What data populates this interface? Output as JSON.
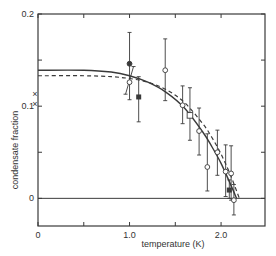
{
  "chart_data": {
    "type": "scatter",
    "title": "",
    "xlabel": "temperature (K)",
    "ylabel": "condensate fraction",
    "xlim": [
      0,
      2.48
    ],
    "ylim": [
      -0.03,
      0.2
    ],
    "grid": false,
    "legend": null,
    "x_ticks": [
      0,
      0.5,
      1.0,
      1.5,
      2.0
    ],
    "x_tick_labels": [
      "0",
      "",
      "1.0",
      "",
      "2.0"
    ],
    "y_ticks": [
      0,
      0.05,
      0.1,
      0.15,
      0.2
    ],
    "y_tick_labels": [
      "0",
      "",
      "0.1",
      "",
      "0.2"
    ],
    "zero_line": true,
    "axis_markers": [
      {
        "marker": "x",
        "x": 0,
        "y": 0.113
      },
      {
        "marker": "x",
        "x": 0,
        "y": 0.102
      }
    ],
    "series": [
      {
        "name": "filled circle",
        "marker": "filled-circle",
        "points": [
          {
            "x": 1.0,
            "y": 0.146,
            "ylo": 0.107,
            "yhi": 0.18
          }
        ]
      },
      {
        "name": "filled square",
        "marker": "filled-square",
        "points": [
          {
            "x": 1.1,
            "y": 0.11,
            "ylo": 0.083,
            "yhi": 0.132
          },
          {
            "x": 2.09,
            "y": 0.009,
            "ylo": 0.0,
            "yhi": 0.02
          }
        ]
      },
      {
        "name": "open square",
        "marker": "open-square",
        "points": [
          {
            "x": 1.66,
            "y": 0.09,
            "ylo": 0.063,
            "yhi": 0.12
          }
        ]
      },
      {
        "name": "open circle",
        "marker": "open-circle",
        "points": [
          {
            "x": 1.0,
            "y": 0.126,
            "ylo": 0.113,
            "yhi": 0.143,
            "tilted": true
          },
          {
            "x": 1.39,
            "y": 0.139,
            "ylo": 0.106,
            "yhi": 0.173
          },
          {
            "x": 1.58,
            "y": 0.101,
            "ylo": 0.081,
            "yhi": 0.122
          },
          {
            "x": 1.76,
            "y": 0.073,
            "ylo": 0.047,
            "yhi": 0.098
          },
          {
            "x": 1.85,
            "y": 0.034,
            "ylo": 0.008,
            "yhi": 0.07
          },
          {
            "x": 1.96,
            "y": 0.05,
            "ylo": 0.025,
            "yhi": 0.074
          },
          {
            "x": 2.05,
            "y": 0.029,
            "ylo": 0.002,
            "yhi": 0.058
          },
          {
            "x": 2.11,
            "y": 0.027,
            "ylo": -0.002,
            "yhi": 0.057
          },
          {
            "x": 2.14,
            "y": -0.002,
            "ylo": -0.018,
            "yhi": 0.015
          }
        ]
      }
    ],
    "curves": [
      {
        "name": "solid theory",
        "style": "solid",
        "x": [
          0,
          0.5,
          0.8,
          1.0,
          1.2,
          1.4,
          1.6,
          1.8,
          1.9,
          2.0,
          2.1,
          2.17
        ],
        "y": [
          0.139,
          0.139,
          0.137,
          0.133,
          0.126,
          0.115,
          0.098,
          0.072,
          0.056,
          0.038,
          0.016,
          0.0
        ]
      },
      {
        "name": "dashed theory",
        "style": "dashed",
        "x": [
          0,
          0.5,
          0.8,
          1.0,
          1.2,
          1.4,
          1.6,
          1.8,
          1.9,
          2.0,
          2.1,
          2.2
        ],
        "y": [
          0.133,
          0.133,
          0.132,
          0.13,
          0.126,
          0.118,
          0.104,
          0.081,
          0.066,
          0.048,
          0.026,
          0.0
        ]
      }
    ]
  }
}
